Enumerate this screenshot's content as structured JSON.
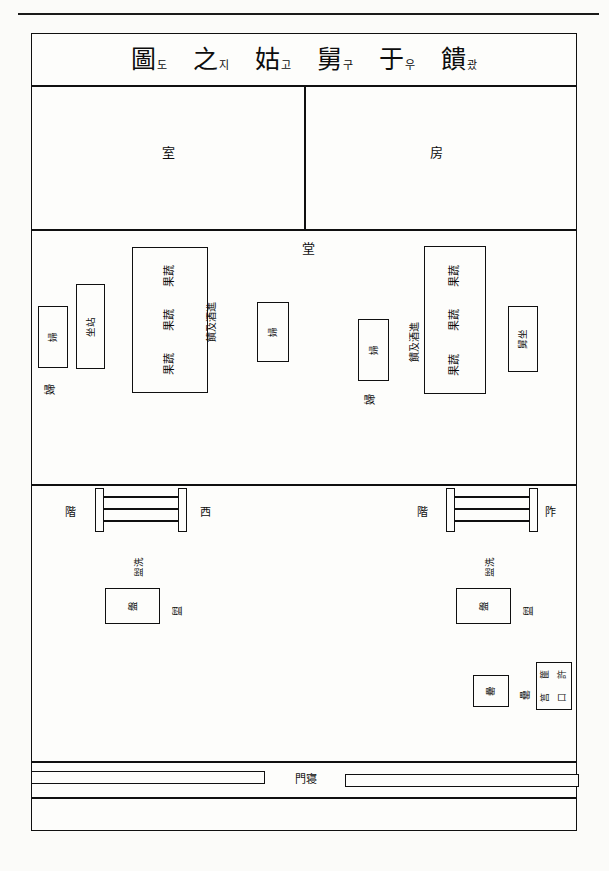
{
  "page": {
    "running_head": "",
    "figure_title_units": [
      {
        "han": "圖",
        "kor": "도"
      },
      {
        "han": "之",
        "kor": "지"
      },
      {
        "han": "姑",
        "kor": "고"
      },
      {
        "han": "舅",
        "kor": "구"
      },
      {
        "han": "于",
        "kor": "우"
      },
      {
        "han": "饋",
        "kor": "괐"
      }
    ],
    "title_plain": "饋于舅姑之圖"
  },
  "rooms": {
    "shil": "室",
    "bang": "房",
    "dang": "堂"
  },
  "hall": {
    "left_group": {
      "bride_box_char": "婦",
      "bride_side_char": "婦",
      "seat_box_chars": "坐站",
      "offering_box_rows": [
        "果蔬",
        "果蔬",
        "果蔬"
      ],
      "offering_side_label": "饋及酒進",
      "attendant_box_char": "婦"
    },
    "right_group": {
      "attendant_box_char": "婦",
      "attendant_side_char": "婦",
      "offering_side_label": "饋及酒進",
      "offering_box_rows": [
        "果蔬",
        "果蔬",
        "果蔬"
      ],
      "seat_box_chars": "舅坐"
    }
  },
  "steps": {
    "west_label_a": "階",
    "west_label_b": "西",
    "east_label_a": "階",
    "east_label_b": "阼"
  },
  "courtyard": {
    "left": {
      "wash_label": "盥洗",
      "basin_box_char": "盤",
      "basin_side_char": "盥"
    },
    "right": {
      "wash_label": "盥洗",
      "basin_box_char": "盤",
      "basin_side_char": "盥"
    },
    "vessel_box_char": "罍",
    "vessel_side_char": "罍",
    "rack_box_chars": [
      "篚",
      "許",
      "筥",
      "口"
    ]
  },
  "gate": {
    "label": "門寝",
    "label_plain": "寝門"
  }
}
